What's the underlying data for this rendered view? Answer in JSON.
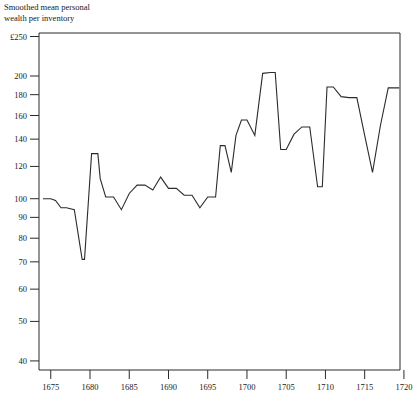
{
  "chart_data": {
    "type": "line",
    "title_line1": "Smoothed mean personal",
    "title_line2": "wealth per inventory",
    "xlabel": "",
    "ylabel": "£",
    "yscale": "log",
    "ylim": [
      38,
      255
    ],
    "xlim": [
      1673.5,
      1719.5
    ],
    "grid": false,
    "legend": false,
    "currency_symbol": "£",
    "y_ticks": [
      250,
      200,
      180,
      160,
      140,
      120,
      100,
      90,
      80,
      70,
      60,
      50,
      40
    ],
    "y_tick_labels": [
      "£250",
      "200",
      "180",
      "160",
      "140",
      "120",
      "100",
      "90",
      "80",
      "70",
      "60",
      "50",
      "40"
    ],
    "x_ticks": [
      1675,
      1680,
      1685,
      1690,
      1695,
      1700,
      1705,
      1710,
      1715,
      1720
    ],
    "x_tick_labels": [
      "1675",
      "1680",
      "1685",
      "1690",
      "1695",
      "1700",
      "1705",
      "1710",
      "1715",
      "1720"
    ],
    "series": [
      {
        "name": "Smoothed mean personal wealth per inventory",
        "color": "#2b2b2b",
        "x": [
          1674.0,
          1675.0,
          1675.6,
          1676.3,
          1677.0,
          1678.0,
          1679.0,
          1679.3,
          1680.2,
          1681.0,
          1681.3,
          1682.0,
          1683.0,
          1684.0,
          1685.0,
          1686.0,
          1687.0,
          1688.0,
          1689.0,
          1690.0,
          1691.0,
          1692.0,
          1693.0,
          1694.0,
          1695.0,
          1696.0,
          1696.6,
          1697.2,
          1698.0,
          1698.6,
          1699.3,
          1700.0,
          1701.0,
          1702.0,
          1703.0,
          1703.6,
          1704.3,
          1705.0,
          1706.0,
          1707.0,
          1708.0,
          1709.0,
          1709.6,
          1710.2,
          1711.0,
          1712.0,
          1713.0,
          1714.0,
          1715.0,
          1716.0,
          1717.0,
          1718.0,
          1719.4
        ],
        "values": [
          100,
          100,
          99,
          95,
          95,
          94,
          71,
          71,
          129,
          129,
          112,
          101,
          101,
          94,
          103,
          108,
          108,
          105,
          113,
          106,
          106,
          102,
          102,
          95,
          101,
          101,
          135,
          135,
          116,
          143,
          156,
          156,
          143,
          203,
          204,
          204,
          132,
          132,
          144,
          150,
          150,
          107,
          107,
          188,
          188,
          178,
          177,
          177,
          143,
          116,
          151,
          187,
          187
        ]
      }
    ],
    "annotations": []
  }
}
